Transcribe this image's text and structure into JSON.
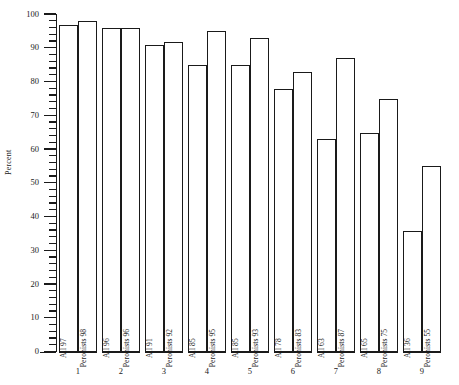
{
  "chart_data": {
    "type": "bar",
    "title": "",
    "subtitle": "",
    "xlabel": "",
    "ylabel": "Percent",
    "ylim": [
      0,
      100
    ],
    "y_major_step": 10,
    "y_minor_step": 2,
    "grid": false,
    "legend": "none",
    "orientation": "vertical",
    "bar_style": "outline",
    "categories": [
      "1",
      "2",
      "3",
      "4",
      "5",
      "6",
      "7",
      "8",
      "9"
    ],
    "series": [
      {
        "name": "All",
        "values": [
          97,
          96,
          91,
          85,
          85,
          78,
          63,
          65,
          36
        ]
      },
      {
        "name": "Peronists",
        "values": [
          98,
          96,
          92,
          95,
          93,
          83,
          87,
          75,
          55
        ]
      }
    ],
    "bars": [
      {
        "group": "1",
        "series": "All",
        "value": 97,
        "label": "All 97"
      },
      {
        "group": "1",
        "series": "Peronists",
        "value": 98,
        "label": "Peronists 98"
      },
      {
        "group": "2",
        "series": "All",
        "value": 96,
        "label": "All 96"
      },
      {
        "group": "2",
        "series": "Peronists",
        "value": 96,
        "label": "Peronists 96"
      },
      {
        "group": "3",
        "series": "All",
        "value": 91,
        "label": "All 91"
      },
      {
        "group": "3",
        "series": "Peronists",
        "value": 92,
        "label": "Peronists 92"
      },
      {
        "group": "4",
        "series": "All",
        "value": 85,
        "label": "All 85"
      },
      {
        "group": "4",
        "series": "Peronists",
        "value": 95,
        "label": "Peronists 95"
      },
      {
        "group": "5",
        "series": "All",
        "value": 85,
        "label": "All 85"
      },
      {
        "group": "5",
        "series": "Peronists",
        "value": 93,
        "label": "Peronists 93"
      },
      {
        "group": "6",
        "series": "All",
        "value": 78,
        "label": "All 78"
      },
      {
        "group": "6",
        "series": "Peronists",
        "value": 83,
        "label": "Peronists 83"
      },
      {
        "group": "7",
        "series": "All",
        "value": 63,
        "label": "All 63"
      },
      {
        "group": "7",
        "series": "Peronists",
        "value": 87,
        "label": "Peronists 87"
      },
      {
        "group": "8",
        "series": "All",
        "value": 65,
        "label": "All 65"
      },
      {
        "group": "8",
        "series": "Peronists",
        "value": 75,
        "label": "Peronists 75"
      },
      {
        "group": "9",
        "series": "All",
        "value": 36,
        "label": "All 36"
      },
      {
        "group": "9",
        "series": "Peronists",
        "value": 55,
        "label": "Peronists 55"
      }
    ],
    "y_tick_labels": [
      "0",
      "10",
      "20",
      "30",
      "40",
      "50",
      "60",
      "70",
      "80",
      "90",
      "100"
    ],
    "x_tick_labels": [
      "1",
      "2",
      "3",
      "4",
      "5",
      "6",
      "7",
      "8",
      "9"
    ],
    "colors": {
      "ink": "#1a1a1a",
      "background": "#ffffff",
      "bar_fill": "#ffffff",
      "bar_stroke": "#1a1a1a"
    }
  }
}
